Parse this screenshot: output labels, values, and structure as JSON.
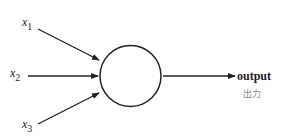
{
  "diagram": {
    "inputs": [
      {
        "symbol": "x",
        "index": "1"
      },
      {
        "symbol": "x",
        "index": "2"
      },
      {
        "symbol": "x",
        "index": "3"
      }
    ],
    "node": "neuron",
    "output": {
      "label": "output",
      "sublabel": "出力"
    },
    "colors": {
      "stroke": "#222222",
      "sublabel": "#888888"
    }
  }
}
